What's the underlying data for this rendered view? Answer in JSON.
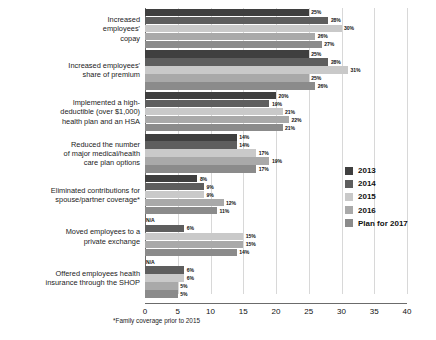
{
  "chart_data": {
    "type": "bar",
    "orientation": "horizontal",
    "title": "",
    "xlabel": "",
    "ylabel": "",
    "xlim": [
      0,
      40
    ],
    "xticks": [
      "0",
      "5",
      "10",
      "15",
      "20",
      "25",
      "30",
      "35",
      "40"
    ],
    "grid": true,
    "legend_position": "right",
    "value_suffix": "%",
    "na_text": "N/A",
    "categories": [
      "Increased\nemployees'\ncopay",
      "Increased employees'\nshare of premium",
      "Implemented a high-\ndeductible (over $1,000)\nhealth plan and an HSA",
      "Reduced the number\nof major medical/health\ncare plan options",
      "Eliminated contributions for\nspouse/partner coverage*",
      "Moved employees to a\nprivate exchange",
      "Offered employees health\ninsurance through the SHOP"
    ],
    "series": [
      {
        "name": "2013",
        "color": "#3f3f3f",
        "values": [
          25,
          25,
          20,
          14,
          8,
          null,
          null
        ],
        "labels": [
          "25%",
          "25%",
          "20%",
          "14%",
          "8%",
          "N/A",
          "N/A"
        ]
      },
      {
        "name": "2014",
        "color": "#5e5e5e",
        "values": [
          28,
          28,
          19,
          14,
          9,
          6,
          6
        ],
        "labels": [
          "28%",
          "28%",
          "19%",
          "14%",
          "9%",
          "6%",
          "6%"
        ]
      },
      {
        "name": "2015",
        "color": "#c9c9c9",
        "values": [
          30,
          31,
          21,
          17,
          9,
          15,
          6
        ],
        "labels": [
          "30%",
          "31%",
          "21%",
          "17%",
          "9%",
          "15%",
          "6%"
        ]
      },
      {
        "name": "2016",
        "color": "#a9a9a9",
        "values": [
          26,
          25,
          22,
          19,
          12,
          15,
          5
        ],
        "labels": [
          "26%",
          "25%",
          "22%",
          "19%",
          "12%",
          "15%",
          "5%"
        ]
      },
      {
        "name": "Plan for 2017",
        "color": "#8b8b8b",
        "values": [
          27,
          26,
          21,
          17,
          11,
          14,
          5
        ],
        "labels": [
          "27%",
          "26%",
          "21%",
          "17%",
          "11%",
          "14%",
          "5%"
        ]
      }
    ]
  },
  "legend": {
    "items": [
      {
        "label": "2013",
        "color": "#3f3f3f"
      },
      {
        "label": "2014",
        "color": "#5e5e5e"
      },
      {
        "label": "2015",
        "color": "#c9c9c9"
      },
      {
        "label": "2016",
        "color": "#a9a9a9"
      },
      {
        "label": "Plan for 2017",
        "color": "#8b8b8b"
      }
    ]
  },
  "footnote": "*Family coverage prior to 2015",
  "source": ""
}
